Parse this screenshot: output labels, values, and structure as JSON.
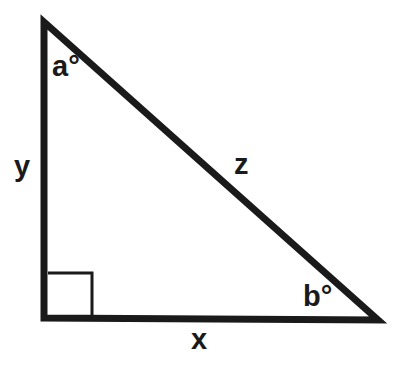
{
  "figure": {
    "kind": "right-triangle-diagram",
    "background_color": "#ffffff",
    "stroke_color": "#1a1a1a",
    "label_color": "#1a1a1a"
  },
  "geometry": {
    "vertices": {
      "top_left": {
        "x": 44,
        "y": 22
      },
      "bottom_left": {
        "x": 44,
        "y": 318
      },
      "bottom_right": {
        "x": 378,
        "y": 320
      }
    },
    "stroke_width": 7,
    "right_angle_marker": {
      "at_vertex": "bottom_left",
      "x": 48,
      "y": 273,
      "size": 44,
      "stroke_width": 3
    }
  },
  "labels": {
    "angle_top": "a°",
    "angle_bottom_right": "b°",
    "side_vertical": "y",
    "side_horizontal": "x",
    "side_hypotenuse": "z"
  },
  "label_meaning": {
    "angle_top": "angle at top vertex, in degrees",
    "angle_bottom_right": "angle at bottom-right vertex, in degrees",
    "side_vertical": "vertical leg (opposite angle b)",
    "side_horizontal": "horizontal leg (opposite angle a)",
    "side_hypotenuse": "hypotenuse (opposite the right angle)"
  }
}
